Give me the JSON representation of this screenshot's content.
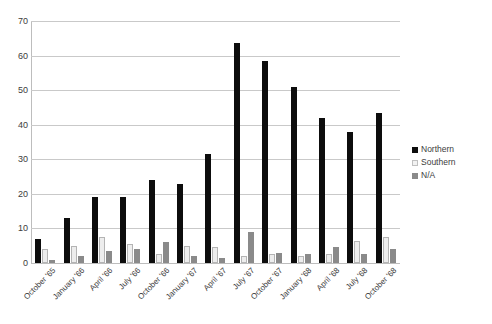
{
  "chart_data": {
    "type": "bar",
    "title": "",
    "subtitle": "",
    "xlabel": "",
    "ylabel": "",
    "ylim": [
      0,
      70
    ],
    "ytick_step": 10,
    "yticks": [
      70,
      60,
      50,
      40,
      30,
      20,
      10,
      0
    ],
    "grid": true,
    "legend_position": "right",
    "categories": [
      "October '65",
      "January '66",
      "April '66",
      "July '66",
      "October '66",
      "January '67",
      "April '67",
      "July '67",
      "October '67",
      "January '68",
      "April '68",
      "July '68",
      "October '68"
    ],
    "series": [
      {
        "name": "Northern",
        "color": "#0d0d0d",
        "values": [
          7,
          13,
          19,
          19,
          24,
          23,
          31.5,
          63.5,
          58.5,
          51,
          42,
          38,
          43.5
        ]
      },
      {
        "name": "Southern",
        "color": "#ededed",
        "values": [
          4,
          5,
          7.5,
          5.5,
          2.5,
          5,
          4.5,
          2,
          2.5,
          2,
          2.5,
          6.5,
          7.5
        ]
      },
      {
        "name": "N/A",
        "color": "#8a8a8a",
        "values": [
          1,
          2,
          3.5,
          4,
          6,
          2,
          1.5,
          9,
          3,
          2.5,
          4.5,
          2.5,
          4
        ]
      }
    ]
  },
  "legend": {
    "items": [
      {
        "label": "Northern"
      },
      {
        "label": "Southern"
      },
      {
        "label": "N/A"
      }
    ]
  }
}
